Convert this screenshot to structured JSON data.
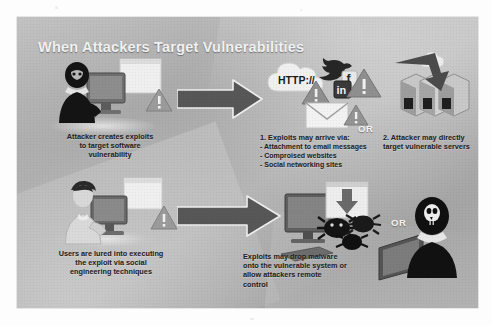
{
  "document": {
    "type": "scanned-infographic",
    "background_color": "#ffffff"
  },
  "slide": {
    "title": "When Attackers Target Vulnerabilities",
    "background_color": "#adadad",
    "title_color": "#f2f2f2",
    "text_color": "#202020"
  },
  "flow": {
    "row1": {
      "left_caption": {
        "line1": "Attacker creates exploits",
        "line2": "to target software",
        "line3": "vulnerability"
      },
      "arrow": "right-arrow-1",
      "middle_caption": {
        "heading": "1. Exploits may arrive  via:",
        "bullets": [
          "- Attachment to email messages",
          "- Comproised websites",
          "- Social networking sites"
        ]
      },
      "or_label": "OR",
      "right_caption": {
        "line1": "2. Attacker may directly",
        "line2": "target vulnerable servers"
      },
      "cloud_label": "HTTP://",
      "social_icons": [
        "linkedin-in-icon",
        "facebook-f-icon",
        "twitter-bird-icon"
      ],
      "warning_glyph": "!"
    },
    "row2": {
      "left_caption": {
        "line1": "Users are lured into executing",
        "line2": "the exploit via social",
        "line3": "engineering techniques"
      },
      "arrow": "right-arrow-2",
      "middle_caption": {
        "line1": "Exploits may drop malware",
        "line2": "onto the vulnerable system or",
        "line3": "allow attackers remote",
        "line4": "control"
      },
      "or_label": "OR"
    }
  },
  "icons": {
    "attacker_figure": "masked-attacker-icon",
    "user_figure": "office-user-icon",
    "monitor": "monitor-icon",
    "document_screen": "document-icon",
    "warning_triangle": "warning-triangle-icon",
    "server_rack": "server-rack-icon",
    "envelope": "envelope-icon",
    "cloud": "cloud-icon",
    "download_box": "download-arrow-icon",
    "malware_bug": "malware-bug-icon",
    "skull_mask": "skull-attacker-icon"
  },
  "colors": {
    "arrow_fill": "#585858",
    "dark_figure": "#1d1d1d",
    "light_figure": "#cfcfcf",
    "warning_triangle": "#9a9a9a",
    "cloud": "#efefef"
  }
}
